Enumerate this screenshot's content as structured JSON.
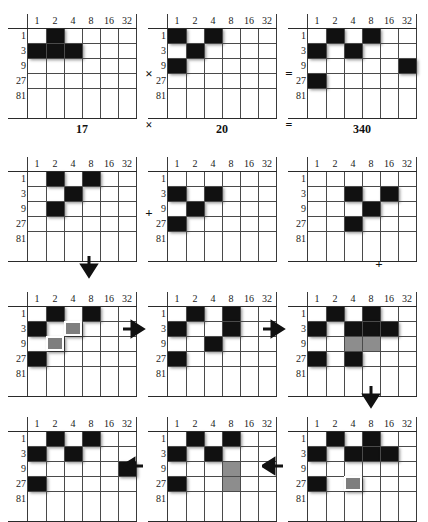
{
  "figure": {
    "column_headers": [
      "1",
      "2",
      "4",
      "8",
      "16",
      "32"
    ],
    "row_headers": [
      "1",
      "3",
      "9",
      "27",
      "81"
    ],
    "grid_cols": 6,
    "grid_rows": 5,
    "colors": {
      "cell_on": "#111111",
      "cell_gray": "#8d8d8d",
      "highlight_fill": "#7e7e7e",
      "highlight_border": "#ffffff",
      "gridline": "#4a4a4a",
      "text": "#111111",
      "background": "#ffffff"
    }
  },
  "rows": [
    {
      "id": "row-1",
      "grids": [
        {
          "id": "grid-1-1",
          "caption": "17",
          "cells_on": [
            [
              0,
              1
            ],
            [
              1,
              0
            ],
            [
              1,
              1
            ],
            [
              1,
              2
            ]
          ],
          "cells_gray": [],
          "cells_highlight": []
        },
        {
          "id": "grid-1-2",
          "caption": "20",
          "cells_on": [
            [
              0,
              0
            ],
            [
              0,
              2
            ],
            [
              1,
              1
            ],
            [
              2,
              0
            ]
          ],
          "cells_gray": [],
          "cells_highlight": []
        },
        {
          "id": "grid-1-3",
          "caption": "340",
          "cells_on": [
            [
              0,
              1
            ],
            [
              0,
              3
            ],
            [
              1,
              0
            ],
            [
              1,
              2
            ],
            [
              2,
              5
            ],
            [
              3,
              0
            ]
          ],
          "cells_gray": [],
          "cells_highlight": []
        }
      ],
      "operators": [
        {
          "symbol": "×",
          "name": "multiply-operator-grid"
        },
        {
          "symbol": "=",
          "name": "equals-operator-grid"
        }
      ],
      "caption_operators": [
        {
          "symbol": "×",
          "name": "multiply-operator-caption"
        },
        {
          "symbol": "=",
          "name": "equals-operator-caption"
        }
      ]
    },
    {
      "id": "row-2",
      "grids": [
        {
          "id": "grid-2-1",
          "caption": "",
          "cells_on": [
            [
              0,
              1
            ],
            [
              0,
              3
            ],
            [
              1,
              2
            ],
            [
              2,
              1
            ]
          ],
          "cells_gray": [],
          "cells_highlight": []
        },
        {
          "id": "grid-2-2",
          "caption": "",
          "cells_on": [
            [
              1,
              0
            ],
            [
              1,
              2
            ],
            [
              2,
              1
            ],
            [
              3,
              0
            ]
          ],
          "cells_gray": [],
          "cells_highlight": []
        },
        {
          "id": "grid-2-3",
          "caption": "",
          "cells_on": [
            [
              1,
              2
            ],
            [
              1,
              4
            ],
            [
              2,
              3
            ],
            [
              3,
              2
            ]
          ],
          "cells_gray": [],
          "cells_highlight": []
        }
      ],
      "operators": [
        {
          "symbol": "+",
          "name": "plus-operator-row2"
        }
      ]
    },
    {
      "id": "row-3",
      "grids": [
        {
          "id": "grid-3-1",
          "caption": "",
          "cells_on": [
            [
              0,
              1
            ],
            [
              0,
              3
            ],
            [
              1,
              0
            ],
            [
              3,
              0
            ]
          ],
          "cells_gray": [],
          "cells_highlight": [
            [
              1,
              2
            ],
            [
              2,
              1
            ]
          ]
        },
        {
          "id": "grid-3-2",
          "caption": "",
          "cells_on": [
            [
              0,
              1
            ],
            [
              0,
              3
            ],
            [
              1,
              0
            ],
            [
              1,
              3
            ],
            [
              2,
              2
            ],
            [
              3,
              0
            ]
          ],
          "cells_gray": [],
          "cells_highlight": []
        },
        {
          "id": "grid-3-3",
          "caption": "",
          "cells_on": [
            [
              0,
              1
            ],
            [
              0,
              3
            ],
            [
              1,
              0
            ],
            [
              1,
              2
            ],
            [
              1,
              3
            ],
            [
              1,
              4
            ],
            [
              3,
              0
            ],
            [
              3,
              2
            ]
          ],
          "cells_gray": [
            [
              2,
              2
            ],
            [
              2,
              3
            ]
          ],
          "cells_highlight": []
        }
      ],
      "operators": []
    },
    {
      "id": "row-4",
      "grids": [
        {
          "id": "grid-4-1",
          "caption": "",
          "cells_on": [
            [
              0,
              1
            ],
            [
              0,
              3
            ],
            [
              1,
              0
            ],
            [
              1,
              2
            ],
            [
              2,
              5
            ],
            [
              3,
              0
            ]
          ],
          "cells_gray": [],
          "cells_highlight": []
        },
        {
          "id": "grid-4-2",
          "caption": "",
          "cells_on": [
            [
              0,
              1
            ],
            [
              0,
              3
            ],
            [
              1,
              0
            ],
            [
              1,
              2
            ],
            [
              3,
              0
            ]
          ],
          "cells_gray": [
            [
              2,
              3
            ],
            [
              3,
              3
            ]
          ],
          "cells_highlight": []
        },
        {
          "id": "grid-4-3",
          "caption": "",
          "cells_on": [
            [
              0,
              1
            ],
            [
              0,
              3
            ],
            [
              1,
              0
            ],
            [
              1,
              2
            ],
            [
              1,
              3
            ],
            [
              1,
              4
            ],
            [
              3,
              0
            ]
          ],
          "cells_gray": [],
          "cells_highlight": [
            [
              3,
              2
            ]
          ]
        }
      ],
      "operators": []
    }
  ],
  "arrows": [
    {
      "name": "arrow-down-row2-to-row3-left",
      "dir": "down",
      "x": 78,
      "y": 255
    },
    {
      "name": "arrow-right-row3-g1-to-g2",
      "dir": "right",
      "x": 122,
      "y": 318
    },
    {
      "name": "arrow-right-row3-g2-to-g3",
      "dir": "right",
      "x": 262,
      "y": 318
    },
    {
      "name": "arrow-down-row3-to-row4-right",
      "dir": "down",
      "x": 360,
      "y": 385
    },
    {
      "name": "arrow-left-row4-g3-to-g2",
      "dir": "left",
      "x": 262,
      "y": 455
    },
    {
      "name": "arrow-left-row4-g2-to-g1",
      "dir": "left",
      "x": 122,
      "y": 455
    }
  ]
}
